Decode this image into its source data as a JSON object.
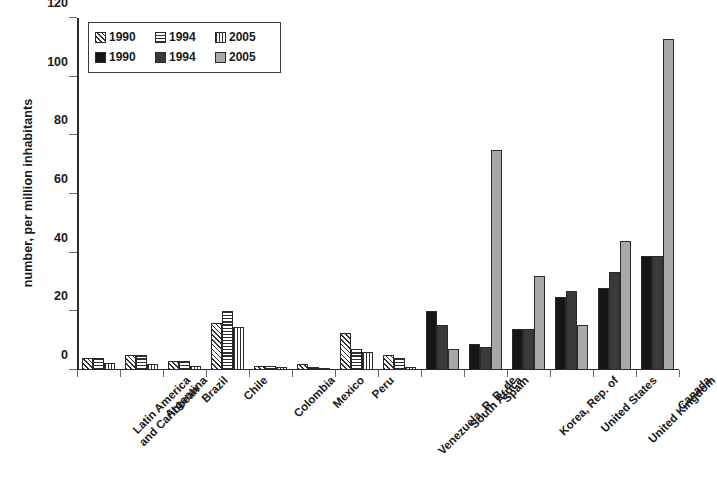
{
  "chart_data": {
    "type": "bar",
    "title": "",
    "subtitle": "",
    "xlabel": "",
    "ylabel": "number, per million inhabitants",
    "ylim": [
      0,
      120
    ],
    "ytick_labels": [
      "0",
      "20",
      "40",
      "60",
      "80",
      "100",
      "120"
    ],
    "ytick_values": [
      0,
      20,
      40,
      60,
      80,
      100,
      120
    ],
    "grid": false,
    "legend_position": "top-left",
    "legend_entries": [
      {
        "label": "1990",
        "pattern": "diagonal-hatch"
      },
      {
        "label": "1994",
        "pattern": "horizontal-hatch"
      },
      {
        "label": "2005",
        "pattern": "vertical-hatch"
      },
      {
        "label": "1990",
        "pattern": "solid-black"
      },
      {
        "label": "1994",
        "pattern": "solid-dark-gray"
      },
      {
        "label": "2005",
        "pattern": "solid-light-gray"
      }
    ],
    "categories": [
      "Latin America\nand Caribbean",
      "Argentina",
      "Brazil",
      "Chile",
      "Colombia",
      "Mexico",
      "Peru",
      "Venezuela, R. B. de",
      "South Africa",
      "Spain",
      "Korea, Rep. of",
      "United States",
      "United Kingdom",
      "Canada"
    ],
    "series": [
      {
        "name": "1990",
        "values": [
          4,
          5,
          3,
          16,
          1.5,
          2,
          12.5,
          5,
          20,
          9,
          14,
          25,
          28,
          39
        ]
      },
      {
        "name": "1994",
        "values": [
          4,
          5,
          3,
          20,
          1.5,
          1,
          7,
          4,
          15.5,
          8,
          14,
          27,
          33.5,
          39
        ]
      },
      {
        "name": "2005",
        "values": [
          2.5,
          2,
          1.5,
          14.5,
          1,
          0.8,
          6,
          1,
          7,
          75,
          32,
          15.5,
          44,
          113
        ]
      }
    ],
    "style_by_category": [
      "hatched",
      "hatched",
      "hatched",
      "hatched",
      "hatched",
      "hatched",
      "hatched",
      "hatched",
      "solid",
      "solid",
      "solid",
      "solid",
      "solid",
      "solid"
    ],
    "colors": {
      "axis": "#2b2b2b",
      "hatch_line": "#2f2f2f",
      "series_1990_solid": "#161616",
      "series_1994_solid": "#3a3a3a",
      "series_2005_solid": "#a8a8a8",
      "background": "#ffffff"
    }
  }
}
